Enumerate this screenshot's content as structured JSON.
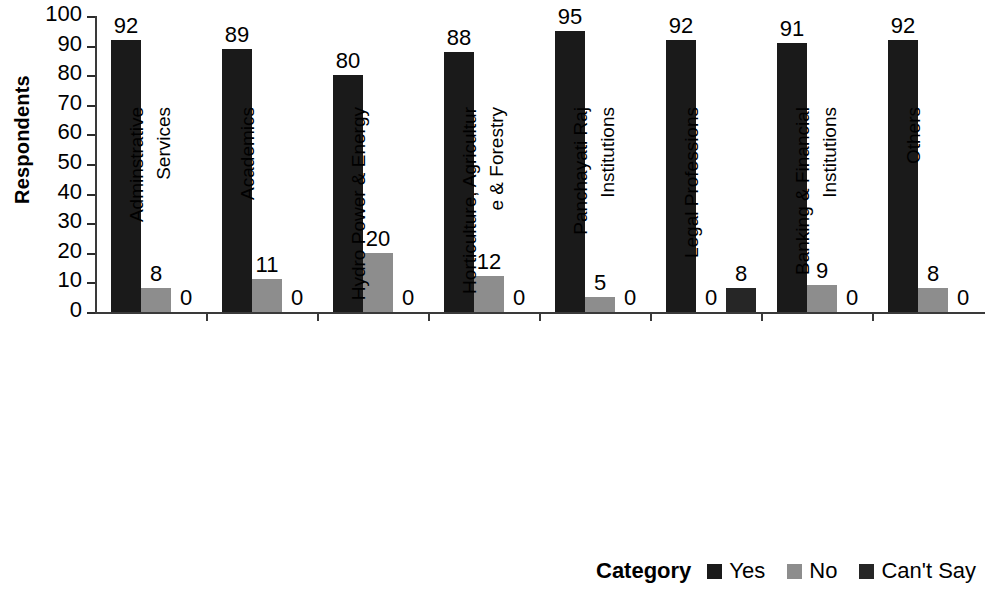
{
  "chart_data": {
    "type": "bar",
    "title": "",
    "xlabel": "",
    "ylabel": "Respondents",
    "ylim": [
      0,
      100
    ],
    "ytick_step": 10,
    "yticks": [
      100,
      90,
      80,
      70,
      60,
      50,
      40,
      30,
      20,
      10,
      0
    ],
    "grid": false,
    "legend_position": "bottom-right",
    "legend_title": "Category",
    "categories": [
      "Adminstrative Services",
      "Academics",
      "Hydro Power & Energy",
      "Horticulture, Agriculture & Forestry",
      "Panchayati Raj Institutions",
      "Legal Professions",
      "Banking & Financial Institutions",
      "Others"
    ],
    "category_lines": [
      [
        "Adminstrative",
        "Services"
      ],
      [
        "Academics",
        ""
      ],
      [
        "Hydro Power & Energy",
        ""
      ],
      [
        "Horticulture, Agricultur",
        "e & Forestry"
      ],
      [
        "Panchayati Raj",
        "Institutions"
      ],
      [
        "Legal Professions",
        ""
      ],
      [
        "Banking & Financial",
        "Institutions"
      ],
      [
        "Others",
        ""
      ]
    ],
    "series": [
      {
        "name": "Yes",
        "color": "#1a1a1a",
        "values": [
          92,
          89,
          80,
          88,
          95,
          92,
          91,
          92
        ]
      },
      {
        "name": "No",
        "color": "#8d8d8d",
        "values": [
          8,
          11,
          20,
          12,
          5,
          0,
          9,
          8
        ]
      },
      {
        "name": "Can't Say",
        "color": "#262626",
        "values": [
          0,
          0,
          0,
          0,
          0,
          8,
          0,
          0
        ]
      }
    ],
    "data_labels": [
      {
        "category": "Adminstrative Services",
        "Yes": "92",
        "No": "8",
        "Can't Say": "0"
      },
      {
        "category": "Academics",
        "Yes": "89",
        "No": "11",
        "Can't Say": "0"
      },
      {
        "category": "Hydro Power & Energy",
        "Yes": "80",
        "No": "20",
        "Can't Say": "0"
      },
      {
        "category": "Horticulture, Agriculture & Forestry",
        "Yes": "88",
        "No": "12",
        "Can't Say": "0"
      },
      {
        "category": "Panchayati Raj Institutions",
        "Yes": "95",
        "No": "5",
        "Can't Say": "0"
      },
      {
        "category": "Legal Professions",
        "Yes": "92",
        "No": "0",
        "Can't Say": "8"
      },
      {
        "category": "Banking & Financial Institutions",
        "Yes": "91",
        "No": "9",
        "Can't Say": "0"
      },
      {
        "category": "Others",
        "Yes": "92",
        "No": "8",
        "Can't Say": "0"
      }
    ]
  },
  "axis": {
    "y_title": "Respondents"
  },
  "legend": {
    "title": "Category",
    "items": [
      {
        "label": "Yes",
        "color": "#1a1a1a"
      },
      {
        "label": "No",
        "color": "#8d8d8d"
      },
      {
        "label": "Can't Say",
        "color": "#262626"
      }
    ]
  }
}
